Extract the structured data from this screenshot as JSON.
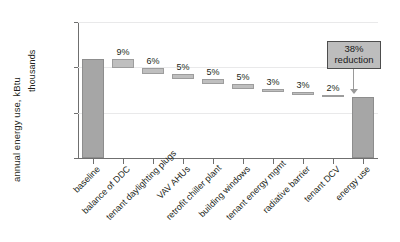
{
  "chart_data": {
    "type": "bar",
    "subtype": "waterfall",
    "title": "",
    "xlabel": "",
    "ylabel": "annual energy use, kBtu",
    "yunits": "thousands",
    "ylim": [
      0,
      300000
    ],
    "yticks": [
      0,
      100000,
      200000,
      300000
    ],
    "ytick_labels": [
      "0",
      "100,000",
      "200,000",
      "300,000"
    ],
    "grid": true,
    "legend": false,
    "categories": [
      "baseline",
      "balance of DDC",
      "tenant daylighting plugs",
      "VAV AHUs",
      "retrofit chiller plant",
      "building windows",
      "tenant energy mgmt",
      "radiative barrier",
      "tenant DCV",
      "energy use"
    ],
    "values": [
      218000,
      196000,
      183000,
      172000,
      161000,
      150000,
      143000,
      137000,
      133000,
      135000
    ],
    "data_labels": [
      "",
      "9%",
      "6%",
      "5%",
      "5%",
      "5%",
      "3%",
      "3%",
      "2%",
      ""
    ],
    "bar_kinds": [
      "total",
      "step",
      "step",
      "step",
      "step",
      "step",
      "step",
      "step",
      "step",
      "total"
    ],
    "step_segments": [
      {
        "category": "balance of DDC",
        "label": "9%",
        "top": 218000,
        "bottom": 198000
      },
      {
        "category": "tenant daylighting plugs",
        "label": "6%",
        "top": 198000,
        "bottom": 185000
      },
      {
        "category": "VAV AHUs",
        "label": "5%",
        "top": 185000,
        "bottom": 174000
      },
      {
        "category": "retrofit chiller plant",
        "label": "5%",
        "top": 174000,
        "bottom": 163000
      },
      {
        "category": "building windows",
        "label": "5%",
        "top": 163000,
        "bottom": 152000
      },
      {
        "category": "tenant energy mgmt",
        "label": "3%",
        "top": 152000,
        "bottom": 145000
      },
      {
        "category": "radiative barrier",
        "label": "3%",
        "top": 145000,
        "bottom": 139000
      },
      {
        "category": "tenant DCV",
        "label": "2%",
        "top": 139000,
        "bottom": 135000
      }
    ],
    "annotations": [
      {
        "name": "reduction-callout",
        "line1": "38%",
        "line2": "reduction",
        "target": "energy use"
      }
    ],
    "colors": {
      "bar_total": "#a6a6a6",
      "bar_step": "#bfbfbf",
      "grid": "#e9e9ea",
      "axis": "#6f6f6f",
      "callout_fill": "#bdbdbd",
      "callout_border": "#4d4d4d",
      "text": "#231f20"
    }
  }
}
